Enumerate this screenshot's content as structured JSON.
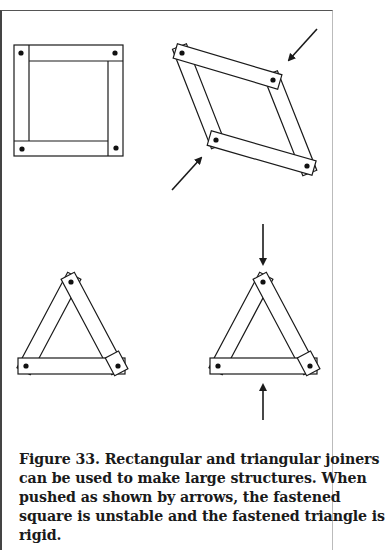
{
  "figure": {
    "number": "Figure 33.",
    "caption_lines": [
      "Figure 33.  Rectangular and triangular joiners",
      "can be used to make large structures. When",
      "pushed as shown by arrows, the fastened",
      "square is unstable and the fastened triangle is",
      "rigid."
    ],
    "panels": [
      {
        "name": "fastened-square",
        "state": "at rest",
        "arrows": 0
      },
      {
        "name": "fastened-square-pushed",
        "state": "collapsed to rhombus",
        "arrows": 2
      },
      {
        "name": "fastened-triangle",
        "state": "at rest",
        "arrows": 0
      },
      {
        "name": "fastened-triangle-pushed",
        "state": "rigid",
        "arrows": 2
      }
    ],
    "colors": {
      "line": "#1a1a1a",
      "background": "#ffffff"
    }
  }
}
